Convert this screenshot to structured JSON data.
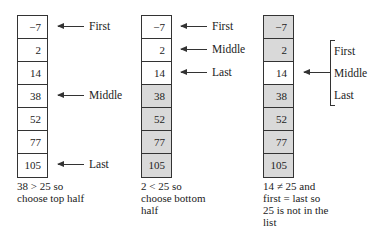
{
  "diagram": {
    "array": [
      "−7",
      "2",
      "14",
      "38",
      "52",
      "77",
      "105"
    ],
    "steps": [
      {
        "excluded": [
          false,
          false,
          false,
          false,
          false,
          false,
          false
        ],
        "pointers": [
          {
            "label": "First",
            "index": 0
          },
          {
            "label": "Middle",
            "index": 3
          },
          {
            "label": "Last",
            "index": 6
          }
        ],
        "caption": [
          "38 > 25 so",
          "choose top half"
        ]
      },
      {
        "excluded": [
          false,
          false,
          false,
          true,
          true,
          true,
          true
        ],
        "pointers": [
          {
            "label": "First",
            "index": 0
          },
          {
            "label": "Middle",
            "index": 1
          },
          {
            "label": "Last",
            "index": 2
          }
        ],
        "caption": [
          "2 < 25 so",
          "choose bottom",
          "half"
        ]
      },
      {
        "excluded": [
          true,
          true,
          false,
          true,
          true,
          true,
          true
        ],
        "pointer_index": 2,
        "bracket_labels": [
          "First",
          "Middle",
          "Last"
        ],
        "caption": [
          "14 ≠ 25 and",
          "first = last so",
          "25 is not in the",
          "list"
        ]
      }
    ],
    "colors": {
      "excluded_fill": "#d9d9d9",
      "active_fill": "#ffffff",
      "stroke": "#333333"
    }
  }
}
